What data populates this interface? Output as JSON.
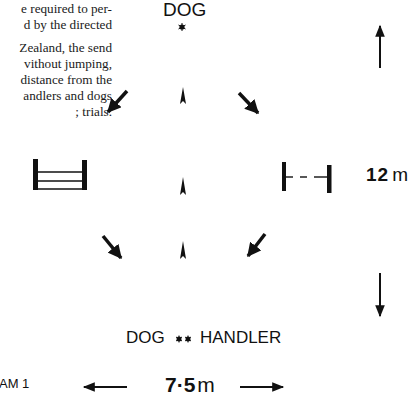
{
  "text_block": {
    "lines_para1": [
      "e required to per-",
      "d by the directed"
    ],
    "lines_para2": [
      "Zealand, the send",
      "vithout jumping,",
      "distance from the",
      "andlers and dogs",
      "; trials."
    ]
  },
  "diagram": {
    "top_label": "DOG",
    "top_marker": "*",
    "bottom_label_dog": "DOG",
    "bottom_marker": "**",
    "bottom_label_handler": "HANDLER",
    "height_dimension": {
      "value": "12",
      "unit": "m"
    },
    "width_dimension": {
      "value": "7·5",
      "unit": "m"
    },
    "caption": "AM 1",
    "colors": {
      "ink": "#111111",
      "background": "#ffffff"
    }
  }
}
